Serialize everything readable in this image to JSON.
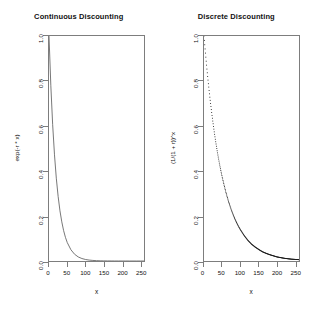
{
  "figure": {
    "background": "#ffffff",
    "axis_color": "#7d7d7d",
    "text_color": "#111111"
  },
  "panels": [
    {
      "id": "continuous",
      "title": "Continuous Discounting",
      "xlabel": "x",
      "ylabel": "exp(-r * x)",
      "xticks": [
        "0",
        "50",
        "100",
        "150",
        "200",
        "250"
      ],
      "yticks": [
        "0.0",
        "0.2",
        "0.4",
        "0.6",
        "0.8",
        "1.0"
      ]
    },
    {
      "id": "discrete",
      "title": "Discrete Discounting",
      "xlabel": "x",
      "ylabel": "(1/(1 + r))^x",
      "xticks": [
        "0",
        "50",
        "100",
        "150",
        "200",
        "250"
      ],
      "yticks": [
        "0.0",
        "0.2",
        "0.4",
        "0.6",
        "0.8",
        "1.0"
      ]
    }
  ],
  "chart_data": [
    {
      "type": "line",
      "title": "Continuous Discounting",
      "xlabel": "x",
      "ylabel": "exp(-r * x)",
      "xlim": [
        0,
        260
      ],
      "ylim": [
        0.0,
        1.0
      ],
      "xticks": [
        0,
        50,
        100,
        150,
        200,
        250
      ],
      "yticks": [
        0.0,
        0.2,
        0.4,
        0.6,
        0.8,
        1.0
      ],
      "grid": false,
      "legend": "none",
      "series": [
        {
          "name": "exp(-r * x)",
          "style": "solid-line",
          "color": "#555555",
          "x": [
            0,
            5,
            10,
            15,
            20,
            25,
            30,
            35,
            40,
            45,
            50,
            60,
            70,
            80,
            90,
            100,
            110,
            120,
            130,
            140,
            150,
            160,
            170,
            180,
            190,
            200,
            210,
            220,
            230,
            240,
            250,
            260
          ],
          "y": [
            1.0,
            0.779,
            0.607,
            0.472,
            0.368,
            0.287,
            0.223,
            0.174,
            0.135,
            0.105,
            0.082,
            0.05,
            0.03,
            0.018,
            0.011,
            0.0067,
            0.0041,
            0.0025,
            0.0015,
            0.0009,
            0.00055,
            0.00034,
            0.0002,
            0.00012,
            8e-05,
            5e-05,
            3e-05,
            2e-05,
            1e-05,
            1e-05,
            0.0,
            0.0
          ]
        }
      ]
    },
    {
      "type": "scatter",
      "title": "Discrete Discounting",
      "xlabel": "x",
      "ylabel": "(1/(1 + r))^x",
      "xlim": [
        0,
        260
      ],
      "ylim": [
        0.0,
        1.0
      ],
      "xticks": [
        0,
        50,
        100,
        150,
        200,
        250
      ],
      "yticks": [
        0.0,
        0.2,
        0.4,
        0.6,
        0.8,
        1.0
      ],
      "grid": false,
      "legend": "none",
      "series": [
        {
          "name": "(1/(1 + r))^x",
          "style": "points",
          "color": "#111111",
          "x": [
            0,
            2,
            4,
            6,
            8,
            10,
            12,
            14,
            16,
            18,
            20,
            22,
            24,
            26,
            28,
            30,
            32,
            34,
            36,
            38,
            40,
            42,
            44,
            46,
            48,
            50,
            55,
            60,
            65,
            70,
            75,
            80,
            85,
            90,
            95,
            100,
            110,
            120,
            130,
            140,
            150,
            160,
            170,
            180,
            190,
            200,
            210,
            220,
            230,
            240,
            250,
            260
          ],
          "y": [
            1.0,
            0.961,
            0.924,
            0.888,
            0.853,
            0.82,
            0.788,
            0.758,
            0.728,
            0.7,
            0.673,
            0.647,
            0.622,
            0.598,
            0.574,
            0.552,
            0.53,
            0.51,
            0.49,
            0.471,
            0.453,
            0.435,
            0.418,
            0.402,
            0.387,
            0.372,
            0.337,
            0.305,
            0.276,
            0.25,
            0.226,
            0.205,
            0.185,
            0.168,
            0.152,
            0.138,
            0.113,
            0.092,
            0.075,
            0.062,
            0.051,
            0.041,
            0.034,
            0.028,
            0.023,
            0.018,
            0.015,
            0.012,
            0.01,
            0.008,
            0.007,
            0.006
          ]
        }
      ]
    }
  ]
}
